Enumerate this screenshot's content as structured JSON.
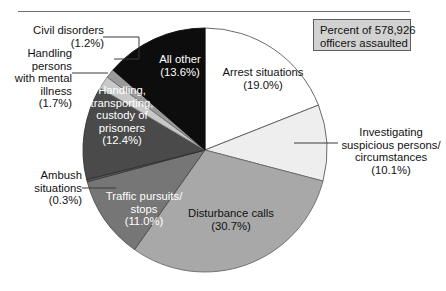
{
  "legend": {
    "line1": "Percent of 578,926",
    "line2": "officers assaulted"
  },
  "chart_data": {
    "type": "pie",
    "title": "",
    "subtitle": "",
    "note": "Percent of 578,926 officers assaulted",
    "total_officers_assaulted": 578926,
    "units": "percent",
    "legend_position": "top-right",
    "grid": false,
    "categories": [
      "Arrest situations",
      "Investigating suspicious persons/circumstances",
      "Disturbance calls",
      "Traffic pursuits/stops",
      "Ambush situations",
      "Handling, transporting, custody of prisoners",
      "Handling persons with mental illness",
      "Civil disorders",
      "All other"
    ],
    "values": [
      19.0,
      10.1,
      30.7,
      11.0,
      0.3,
      12.4,
      1.7,
      1.2,
      13.6
    ],
    "colors": [
      "#ffffff",
      "#eeeeee",
      "#a8a8a8",
      "#767676",
      "#5c5c5c",
      "#4a4a4a",
      "#c8c8c8",
      "#9a9a9a",
      "#0d0d0d"
    ],
    "slices": [
      {
        "label": "Arrest situations",
        "value": 19.0,
        "value_text": "(19.0%)",
        "label_line1": "Arrest situations",
        "label_line2": "(19.0%)",
        "color": "#ffffff",
        "label_placement": "inside",
        "label_color": "dark"
      },
      {
        "label": "Investigating suspicious persons/circumstances",
        "value": 10.1,
        "value_text": "(10.1%)",
        "label_line1": "Investigating",
        "label_line2": "suspicious persons/",
        "label_line3": "circumstances",
        "label_line4": "(10.1%)",
        "color": "#eeeeee",
        "label_placement": "outside-right",
        "label_color": "dark"
      },
      {
        "label": "Disturbance calls",
        "value": 30.7,
        "value_text": "(30.7%)",
        "label_line1": "Disturbance calls",
        "label_line2": "(30.7%)",
        "color": "#a8a8a8",
        "label_placement": "inside",
        "label_color": "dark"
      },
      {
        "label": "Traffic pursuits/stops",
        "value": 11.0,
        "value_text": "(11.0%)",
        "label_line1": "Traffic pursuits/",
        "label_line2": "stops",
        "label_line3": "(11.0%)",
        "color": "#767676",
        "label_placement": "inside",
        "label_color": "light"
      },
      {
        "label": "Ambush situations",
        "value": 0.3,
        "value_text": "(0.3%)",
        "label_line1": "Ambush",
        "label_line2": "situations",
        "label_line3": "(0.3%)",
        "color": "#5c5c5c",
        "label_placement": "outside-left",
        "label_color": "dark"
      },
      {
        "label": "Handling, transporting, custody of prisoners",
        "value": 12.4,
        "value_text": "(12.4%)",
        "label_line1": "Handling,",
        "label_line2": "transporting,",
        "label_line3": "custody of",
        "label_line4": "prisoners",
        "label_line5": "(12.4%)",
        "color": "#4a4a4a",
        "label_placement": "inside",
        "label_color": "light"
      },
      {
        "label": "Handling persons with mental illness",
        "value": 1.7,
        "value_text": "(1.7%)",
        "label_line1": "Handling",
        "label_line2": "persons",
        "label_line3": "with mental",
        "label_line4": "illness",
        "label_line5": "(1.7%)",
        "color": "#c8c8c8",
        "label_placement": "outside-left",
        "label_color": "dark"
      },
      {
        "label": "Civil disorders",
        "value": 1.2,
        "value_text": "(1.2%)",
        "label_line1": "Civil disorders",
        "label_line2": "(1.2%)",
        "color": "#9a9a9a",
        "label_placement": "outside-left",
        "label_color": "dark"
      },
      {
        "label": "All other",
        "value": 13.6,
        "value_text": "(13.6%)",
        "label_line1": "All other",
        "label_line2": "(13.6%)",
        "color": "#0d0d0d",
        "label_placement": "inside",
        "label_color": "light"
      }
    ]
  }
}
